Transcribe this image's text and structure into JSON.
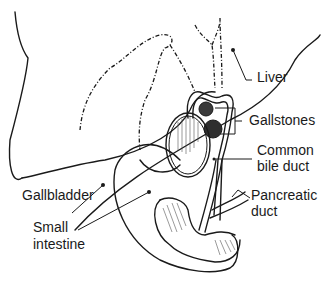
{
  "diagram": {
    "labels": {
      "liver": "Liver",
      "gallstones": "Gallstones",
      "common_bile_duct_line1": "Common",
      "common_bile_duct_line2": "bile duct",
      "pancreatic_duct_line1": "Pancreatic",
      "pancreatic_duct_line2": "duct",
      "gallbladder": "Gallbladder",
      "small_intestine_line1": "Small",
      "small_intestine_line2": "intestine"
    },
    "colors": {
      "ink": "#1a1a1a",
      "background": "#ffffff"
    }
  }
}
